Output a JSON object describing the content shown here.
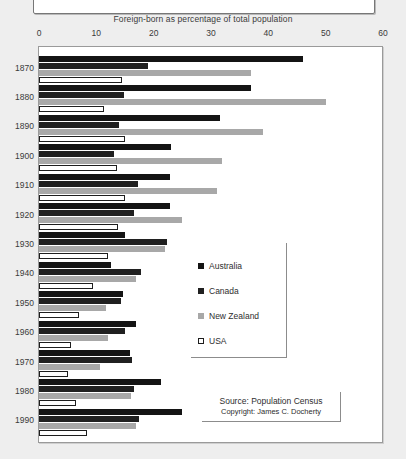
{
  "axis_title": "Foreign-born as percentage of total population",
  "ticks": [
    0,
    10,
    20,
    30,
    40,
    50,
    60
  ],
  "legend": {
    "items": [
      {
        "label": "Australia",
        "key": "aus"
      },
      {
        "label": "Canada",
        "key": "can"
      },
      {
        "label": "New Zealand",
        "key": "nzl"
      },
      {
        "label": "USA",
        "key": "usa"
      }
    ]
  },
  "source": {
    "line1": "Source: Population Census",
    "line2": "Copyright: James C. Docherty"
  },
  "colors": {
    "australia": "#141414",
    "canada": "#202020",
    "new_zealand": "#a8a8a8",
    "usa": "#ffffff",
    "frame": "#9a9a9a",
    "page_background": "#eeeeee",
    "plot_background": "#ffffff",
    "text": "#3a3a3a"
  },
  "chart_data": {
    "type": "bar",
    "orientation": "horizontal",
    "title": "",
    "subtitle": "",
    "xlabel": "Foreign-born as percentage of total population",
    "ylabel": "",
    "xlim": [
      0,
      60
    ],
    "xticks": [
      0,
      10,
      20,
      30,
      40,
      50,
      60
    ],
    "grid": false,
    "legend_position": "center-right",
    "categories": [
      "1870",
      "1880",
      "1890",
      "1900",
      "1910",
      "1920",
      "1930",
      "1940",
      "1950",
      "1960",
      "1970",
      "1980",
      "1990"
    ],
    "series": [
      {
        "name": "Australia",
        "color": "#141414",
        "values": [
          46.0,
          37.0,
          31.5,
          23.0,
          22.8,
          22.8,
          15.0,
          12.5,
          14.7,
          17.0,
          15.8,
          21.3,
          25.0
        ]
      },
      {
        "name": "Canada",
        "color": "#202020",
        "values": [
          19.0,
          14.8,
          14.0,
          13.0,
          17.3,
          16.6,
          22.4,
          17.8,
          14.3,
          15.0,
          16.3,
          16.6,
          17.4
        ]
      },
      {
        "name": "New Zealand",
        "color": "#a8a8a8",
        "values": [
          37.0,
          50.0,
          39.0,
          32.0,
          31.0,
          25.0,
          22.0,
          17.0,
          11.7,
          12.0,
          10.7,
          16.0,
          17.0
        ]
      },
      {
        "name": "USA",
        "color": "#ffffff",
        "values": [
          14.5,
          11.4,
          15.0,
          13.6,
          15.0,
          13.8,
          12.0,
          9.4,
          7.0,
          5.6,
          5.0,
          6.5,
          8.4
        ]
      }
    ]
  }
}
